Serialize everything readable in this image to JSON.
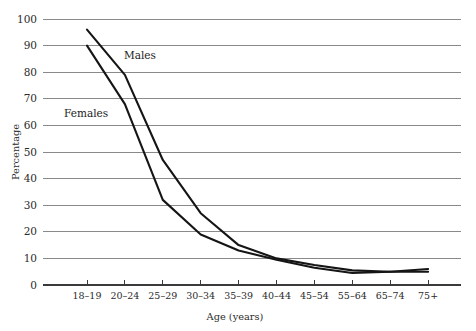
{
  "chart_data": {
    "type": "line",
    "title": "",
    "xlabel": "Age (years)",
    "ylabel": "Percentage",
    "categories": [
      "18–19",
      "20–24",
      "25–29",
      "30–34",
      "35–39",
      "40–44",
      "45–54",
      "55–64",
      "65–74",
      "75+"
    ],
    "series": [
      {
        "name": "Males",
        "label": "Males",
        "color": "#151515",
        "values": [
          96,
          79,
          47,
          27,
          15,
          10,
          7.5,
          5.5,
          5,
          6
        ]
      },
      {
        "name": "Females",
        "label": "Females",
        "color": "#151515",
        "values": [
          90,
          68,
          32,
          19,
          13,
          9.5,
          6.5,
          4.5,
          5,
          5
        ]
      }
    ],
    "ylim": [
      0,
      100
    ],
    "ytick_values": [
      0,
      10,
      20,
      30,
      40,
      50,
      60,
      70,
      80,
      90,
      100
    ],
    "ytick_labels": [
      "0",
      "10",
      "20",
      "30",
      "40",
      "50",
      "60",
      "70",
      "80",
      "90",
      "100"
    ],
    "grid": true,
    "grid_color": "#8a8a8a",
    "legend": "inline-annotations",
    "annotations": [
      {
        "text": "Males",
        "x_index": 1,
        "value": 79,
        "pixel_x": 124,
        "pixel_y": 59
      },
      {
        "text": "Females",
        "x_index": 0,
        "value": 62,
        "pixel_x": 64,
        "pixel_y": 117
      }
    ]
  },
  "layout": {
    "plot_left": 43,
    "plot_right": 461,
    "plot_top": 19,
    "plot_bottom": 285,
    "first_tick_x": 87,
    "tick_spacing": 37.9,
    "axis_color": "#3a3a3a"
  }
}
